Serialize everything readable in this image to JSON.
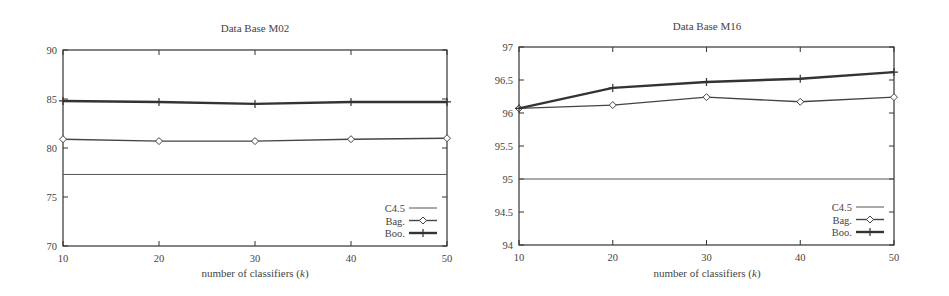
{
  "chart_data": [
    {
      "type": "line",
      "title": "Data Base M02",
      "xlabel": "number of classifiers (k)",
      "ylabel": "",
      "x": [
        10,
        20,
        30,
        40,
        50
      ],
      "xticks": [
        "10",
        "20",
        "30",
        "40",
        "50"
      ],
      "yticks": [
        "70",
        "75",
        "80",
        "85",
        "90"
      ],
      "xlim": [
        10,
        50
      ],
      "ylim": [
        70,
        90
      ],
      "grid": false,
      "legend_position": "lower right",
      "series": [
        {
          "name": "C4.5",
          "marker": "none",
          "values": [
            77.3,
            77.3,
            77.3,
            77.3,
            77.3
          ]
        },
        {
          "name": "Bag.",
          "marker": "diamond",
          "values": [
            80.9,
            80.7,
            80.7,
            80.9,
            81.0
          ]
        },
        {
          "name": "Boo.",
          "marker": "plus",
          "values": [
            84.8,
            84.7,
            84.5,
            84.7,
            84.7
          ]
        }
      ]
    },
    {
      "type": "line",
      "title": "Data Base M16",
      "xlabel": "number of classifiers (k)",
      "ylabel": "",
      "x": [
        10,
        20,
        30,
        40,
        50
      ],
      "xticks": [
        "10",
        "20",
        "30",
        "40",
        "50"
      ],
      "yticks": [
        "94",
        "94.5",
        "95",
        "95.5",
        "96",
        "96.5",
        "97"
      ],
      "xlim": [
        10,
        50
      ],
      "ylim": [
        94,
        97
      ],
      "grid": false,
      "legend_position": "lower right",
      "series": [
        {
          "name": "C4.5",
          "marker": "none",
          "values": [
            95.0,
            95.0,
            95.0,
            95.0,
            95.0
          ]
        },
        {
          "name": "Bag.",
          "marker": "diamond",
          "values": [
            96.07,
            96.12,
            96.24,
            96.17,
            96.24
          ]
        },
        {
          "name": "Boo.",
          "marker": "plus",
          "values": [
            96.07,
            96.38,
            96.47,
            96.52,
            96.62
          ]
        }
      ]
    }
  ],
  "charts": {
    "left": {
      "title": "Data Base M02",
      "xlabel_prefix": "number of classifiers (",
      "xlabel_var": "k",
      "xlabel_suffix": ")",
      "legend": [
        "C4.5",
        "Bag.",
        "Boo."
      ]
    },
    "right": {
      "title": "Data Base M16",
      "xlabel_prefix": "number of classifiers (",
      "xlabel_var": "k",
      "xlabel_suffix": ")",
      "legend": [
        "C4.5",
        "Bag.",
        "Boo."
      ]
    }
  },
  "colors": {
    "axis": "#333333",
    "c45": "#555555",
    "bag": "#444444",
    "boo": "#333333",
    "text": "#444444"
  }
}
